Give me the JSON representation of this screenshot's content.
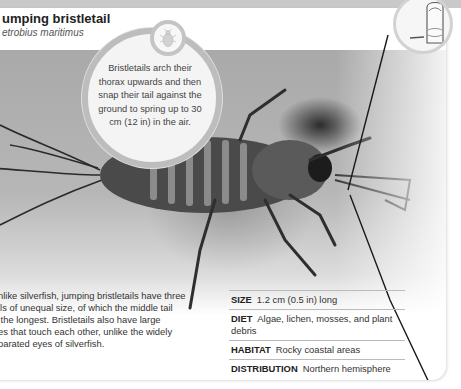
{
  "header": {
    "title": "umping bristletail",
    "latin_name": "etrobius maritimus"
  },
  "callout": {
    "icon": "bug-icon",
    "text": "Bristletails arch their thorax upwards and then snap their tail against the ground to spring up to 30 cm (12 in) in the air."
  },
  "scale_icon": "thumb-scale-icon",
  "description_lines": [
    "nlike silverfish, jumping bristletails have three",
    "ils of unequal size, of which the middle tail",
    " the longest. Bristletails also have large",
    "es that touch each other, unlike the widely",
    "parated eyes of silverfish."
  ],
  "facts": [
    {
      "label": "SIZE",
      "value": "1.2 cm (0.5 in) long"
    },
    {
      "label": "DIET",
      "value": "Algae, lichen, mosses, and plant debris"
    },
    {
      "label": "HABITAT",
      "value": "Rocky coastal areas"
    },
    {
      "label": "DISTRIBUTION",
      "value": "Northern hemisphere"
    }
  ],
  "colors": {
    "background": "#ffffff",
    "top_band": "#c9c9c9",
    "bubble_ring": "#bdbdbd",
    "text": "#333333"
  }
}
